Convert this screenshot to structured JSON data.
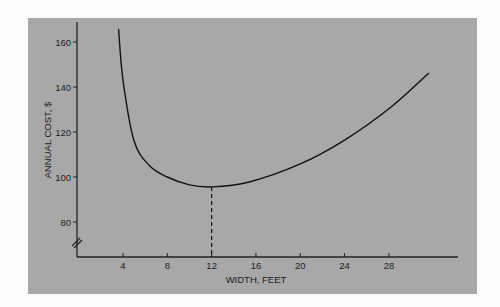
{
  "chart_data": {
    "type": "line",
    "title": "",
    "xlabel": "WIDTH, FEET",
    "ylabel": "ANNUAL COST, $",
    "x_ticks": [
      4,
      8,
      12,
      16,
      20,
      24,
      28
    ],
    "y_ticks": [
      80,
      100,
      120,
      140,
      160
    ],
    "x_tick_labels": [
      "4",
      "8",
      "12",
      "16",
      "20",
      "24",
      "28"
    ],
    "y_tick_labels": [
      "80",
      "100",
      "120",
      "140",
      "160"
    ],
    "xlim": [
      0,
      34
    ],
    "ylim": [
      70,
      165
    ],
    "y_axis_break": true,
    "grid": false,
    "series": [
      {
        "name": "Annual cost",
        "x": [
          3.6,
          4,
          5,
          6.4,
          8,
          10,
          12,
          15.4,
          20,
          24,
          28.2,
          31.6
        ],
        "y": [
          165.8,
          143,
          116,
          105,
          100,
          96.5,
          95.6,
          97.8,
          105.8,
          116.4,
          131.1,
          146.2
        ]
      }
    ],
    "annotations": [
      {
        "type": "dashed-vertical",
        "x": 12,
        "from_y": 95.6,
        "to_y": "axis",
        "meaning": "minimum cost width"
      }
    ]
  }
}
